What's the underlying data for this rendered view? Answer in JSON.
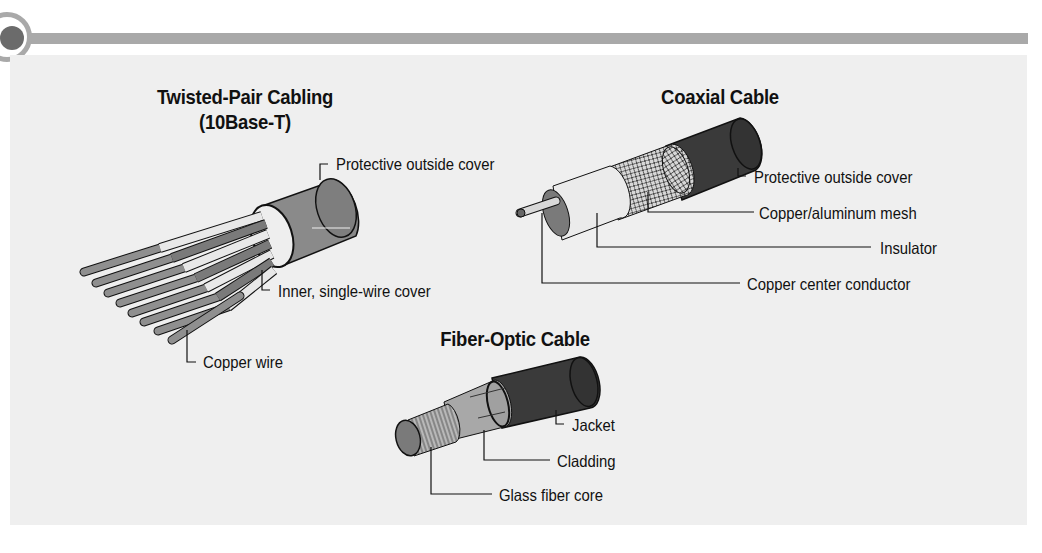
{
  "header": {
    "bar_color": "#a9a9a9",
    "dot_color": "#6b6b6b"
  },
  "panel": {
    "background": "#efefef"
  },
  "twisted_pair": {
    "title_line1": "Twisted-Pair Cabling",
    "title_line2": "(10Base-T)",
    "labels": {
      "outer": "Protective outside cover",
      "inner": "Inner, single-wire cover",
      "wire": "Copper wire"
    }
  },
  "coaxial": {
    "title": "Coaxial Cable",
    "labels": {
      "outer": "Protective outside cover",
      "mesh": "Copper/aluminum mesh",
      "insulator": "Insulator",
      "conductor": "Copper center conductor"
    }
  },
  "fiber_optic": {
    "title": "Fiber-Optic Cable",
    "labels": {
      "jacket": "Jacket",
      "cladding": "Cladding",
      "core": "Glass fiber core"
    }
  },
  "colors": {
    "cable_dark": "#3a3a3a",
    "cable_mid": "#8a8a8a",
    "cable_light": "#e6e6e6",
    "line": "#111111"
  }
}
